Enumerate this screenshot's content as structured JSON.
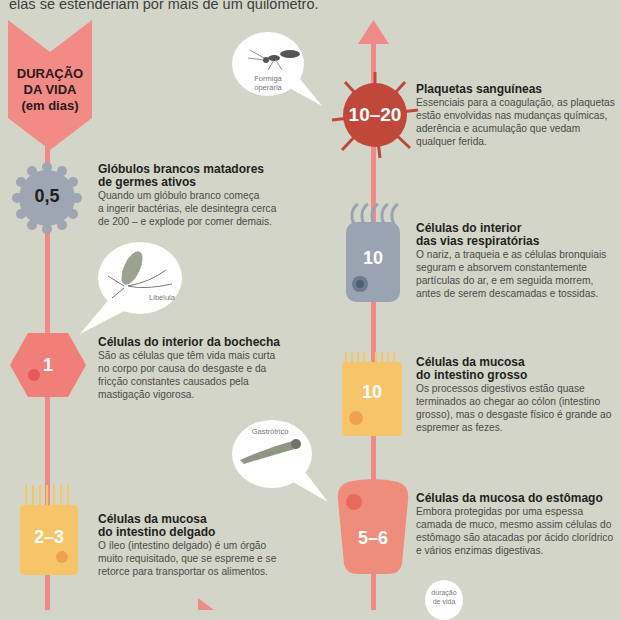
{
  "intro_text": "elas se estenderiam por mais de um quilômetro.",
  "axis_title": {
    "line1": "DURAÇÃO",
    "line2": "DA VIDA",
    "line3": "(em dias)"
  },
  "colors": {
    "background": "#d3d5c8",
    "axis": "#ee8a88",
    "platelet": "#c0483a",
    "white_blood_cell": "#9ea6b3",
    "cheek_cell": "#f07f7a",
    "respiratory_cell": "#9aa3b2",
    "large_intestine_cell": "#f6c56a",
    "small_intestine_cell": "#f6c56a",
    "stomach_cell": "#ee8d7c"
  },
  "items": [
    {
      "value": "0,5",
      "title_line1": "Glóbulos brancos matadores",
      "title_line2": "de germes ativos",
      "body": [
        "Quando um glóbulo branco começa",
        "a ingerir bactérias, ele desintegra cerca",
        "de 200 – e explode por comer demais."
      ]
    },
    {
      "value": "1",
      "title_line1": "Células do interior da bochecha",
      "title_line2": "",
      "body": [
        "São as células que têm vida mais curta",
        "no corpo por causa do desgaste e da",
        "fricção constantes causados pela",
        "mastigação vigorosa."
      ]
    },
    {
      "value": "2–3",
      "title_line1": "Células da mucosa",
      "title_line2": "do intestino delgado",
      "body": [
        "O íleo (intestino delgado) é um órgão",
        "muito requisitado, que se espreme e se",
        "retorce para transportar os alimentos."
      ]
    },
    {
      "value": "10–20",
      "title_line1": "Plaquetas sanguíneas",
      "title_line2": "",
      "body": [
        "Essenciais para a coagulação, as plaquetas",
        "estão envolvidas nas mudanças químicas,",
        "aderência e acumulação que vedam",
        "qualquer ferida."
      ]
    },
    {
      "value": "10",
      "title_line1": "Células do interior",
      "title_line2": "das vias respiratórias",
      "body": [
        "O nariz, a traqueia e as células bronquiais",
        "seguram e absorvem constantemente",
        "partículas do ar, e em seguida morrem,",
        "antes de serem descamadas e tossidas."
      ]
    },
    {
      "value": "10",
      "title_line1": "Células da mucosa",
      "title_line2": "do intestino grosso",
      "body": [
        "Os processos digestivos estão quase",
        "terminados ao chegar ao cólon (intestino",
        "grosso), mas o desgaste físico é grande ao",
        "espremer as fezes."
      ]
    },
    {
      "value": "5–6",
      "title_line1": "Células da mucosa do estômago",
      "title_line2": "",
      "body": [
        "Embora protegidas por uma espessa",
        "camada de muco, mesmo assim células do",
        "estômago são atacadas por ácido clorídrico",
        "e vários enzimas digestivas."
      ]
    }
  ],
  "bubbles": [
    {
      "label_line1": "Formiga",
      "label_line2": "operária"
    },
    {
      "label_line1": "Libélula",
      "label_line2": ""
    },
    {
      "label_line1": "Gastrótrico",
      "label_line2": ""
    },
    {
      "label_line1": "duração",
      "label_line2": "de vida"
    }
  ]
}
